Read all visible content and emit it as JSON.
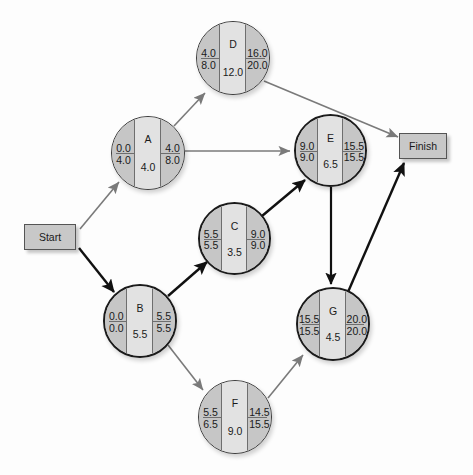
{
  "diagram": {
    "colors": {
      "node_fill_side": "#c6c6c6",
      "node_fill_center": "#e2e2e2",
      "node_border": "#3c3c3c",
      "critical_border": "#1b1b1b",
      "critical_arrow": "#111111",
      "normal_arrow": "#7a7a7a",
      "terminal_fill": "#c8c8c8",
      "background": "#fdfdfd"
    },
    "start": {
      "label": "Start"
    },
    "finish": {
      "label": "Finish"
    },
    "field_legend": {
      "top_left": "ES",
      "bottom_left": "LS",
      "top_right": "EF",
      "bottom_right": "LF",
      "center_top": "Activity",
      "center_bottom": "Duration"
    },
    "nodes": [
      {
        "id": "A",
        "name": "A",
        "es": "0.0",
        "ls": "4.0",
        "ef": "4.0",
        "lf": "8.0",
        "duration": "4.0",
        "critical": false
      },
      {
        "id": "B",
        "name": "B",
        "es": "0.0",
        "ls": "0.0",
        "ef": "5.5",
        "lf": "5.5",
        "duration": "5.5",
        "critical": true
      },
      {
        "id": "C",
        "name": "C",
        "es": "5.5",
        "ls": "5.5",
        "ef": "9.0",
        "lf": "9.0",
        "duration": "3.5",
        "critical": true
      },
      {
        "id": "D",
        "name": "D",
        "es": "4.0",
        "ls": "8.0",
        "ef": "16.0",
        "lf": "20.0",
        "duration": "12.0",
        "critical": false
      },
      {
        "id": "E",
        "name": "E",
        "es": "9.0",
        "ls": "9.0",
        "ef": "15.5",
        "lf": "15.5",
        "duration": "6.5",
        "critical": true
      },
      {
        "id": "F",
        "name": "F",
        "es": "5.5",
        "ls": "6.5",
        "ef": "14.5",
        "lf": "15.5",
        "duration": "9.0",
        "critical": false
      },
      {
        "id": "G",
        "name": "G",
        "es": "15.5",
        "ls": "15.5",
        "ef": "20.0",
        "lf": "20.0",
        "duration": "4.5",
        "critical": true
      }
    ],
    "edges": [
      {
        "from": "Start",
        "to": "A",
        "critical": false
      },
      {
        "from": "Start",
        "to": "B",
        "critical": true
      },
      {
        "from": "A",
        "to": "D",
        "critical": false
      },
      {
        "from": "A",
        "to": "E",
        "critical": false
      },
      {
        "from": "B",
        "to": "C",
        "critical": true
      },
      {
        "from": "B",
        "to": "F",
        "critical": false
      },
      {
        "from": "C",
        "to": "E",
        "critical": true
      },
      {
        "from": "D",
        "to": "Finish",
        "critical": false
      },
      {
        "from": "E",
        "to": "G",
        "critical": true
      },
      {
        "from": "F",
        "to": "G",
        "critical": false
      },
      {
        "from": "G",
        "to": "Finish",
        "critical": true
      }
    ]
  }
}
